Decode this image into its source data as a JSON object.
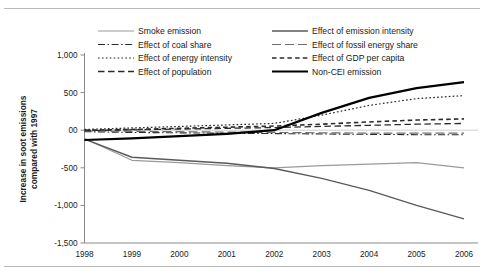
{
  "chart_data": {
    "type": "line",
    "title": "",
    "xlabel": "",
    "ylabel": "Increase in soot emissions compared with 1997",
    "ylabel_line1": "Increase in soot emissions",
    "ylabel_line2": "compared with 1997",
    "x": [
      1998,
      1999,
      2000,
      2001,
      2002,
      2003,
      2004,
      2005,
      2006
    ],
    "categories": [
      "1998",
      "1999",
      "2000",
      "2001",
      "2002",
      "2003",
      "2004",
      "2005",
      "2006"
    ],
    "ylim": [
      -1500,
      1000
    ],
    "yticks": [
      1000,
      500,
      0,
      -500,
      -1000,
      -1500
    ],
    "ytick_labels": [
      "1,000",
      "500",
      "00",
      "-500",
      "-1,000",
      "-1,500"
    ],
    "grid": false,
    "legend_position": "top",
    "legend_columns": 2,
    "series": [
      {
        "name": "Smoke emission",
        "style": "solid",
        "color": "#9a9a9a",
        "width": 1.2,
        "dash": "",
        "values": [
          -110,
          -400,
          -430,
          -470,
          -500,
          -470,
          -450,
          -430,
          -500
        ]
      },
      {
        "name": "Effect of emission intensity",
        "style": "solid",
        "color": "#5a5a5a",
        "width": 1.4,
        "dash": "",
        "values": [
          -120,
          -360,
          -400,
          -440,
          -510,
          -640,
          -800,
          -1000,
          -1180
        ]
      },
      {
        "name": "Effect of coal share",
        "style": "dash-dot",
        "color": "#2b2b2b",
        "width": 1.1,
        "dash": "7,2.5,1.6,2.5",
        "values": [
          -20,
          -30,
          -35,
          -40,
          -45,
          -50,
          -55,
          -60,
          -60
        ]
      },
      {
        "name": "Effect of fossil energy share",
        "style": "long-dash",
        "color": "#6e6e6e",
        "width": 1.2,
        "dash": "9,4",
        "values": [
          -10,
          -15,
          -20,
          -25,
          -30,
          -35,
          -38,
          -40,
          -40
        ]
      },
      {
        "name": "Effect of energy intensity",
        "style": "dotted",
        "color": "#2b2b2b",
        "width": 1.2,
        "dash": "1.7,2.2",
        "values": [
          10,
          30,
          50,
          70,
          90,
          200,
          330,
          420,
          460
        ]
      },
      {
        "name": "Effect of GDP per capita",
        "style": "dash",
        "color": "#2b2b2b",
        "width": 1.6,
        "dash": "4.5,3.2",
        "values": [
          0,
          10,
          25,
          40,
          55,
          80,
          110,
          135,
          150
        ]
      },
      {
        "name": "Effect of population",
        "style": "medium-dash",
        "color": "#2b2b2b",
        "width": 1.3,
        "dash": "6.5,3.5",
        "values": [
          -5,
          5,
          15,
          25,
          35,
          50,
          65,
          80,
          90
        ]
      },
      {
        "name": "Non-CEI emission",
        "style": "thick-solid",
        "color": "#000000",
        "width": 2.2,
        "dash": "",
        "values": [
          -130,
          -110,
          -80,
          -50,
          0,
          230,
          430,
          560,
          640
        ]
      }
    ],
    "legend_order": [
      "Smoke emission",
      "Effect of emission intensity",
      "Effect of coal share",
      "Effect of fossil energy share",
      "Effect of energy intensity",
      "Effect of GDP per capita",
      "Effect of population",
      "Non-CEI emission"
    ]
  }
}
